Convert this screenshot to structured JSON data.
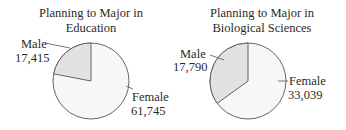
{
  "chart_data": [
    {
      "type": "pie",
      "title": "Planning to Major in Education",
      "title_lines": [
        "Planning to Major in",
        "Education"
      ],
      "categories": [
        "Male",
        "Female"
      ],
      "values": [
        17415,
        61745
      ],
      "value_labels": [
        "17,415",
        "61,745"
      ],
      "colors": [
        "#e2e2e2",
        "#f7f7f7"
      ],
      "start_angle_deg": 0,
      "direction": "counterclockwise"
    },
    {
      "type": "pie",
      "title": "Planning to Major in Biological Sciences",
      "title_lines": [
        "Planning to Major in",
        "Biological Sciences"
      ],
      "categories": [
        "Male",
        "Female"
      ],
      "values": [
        17790,
        33039
      ],
      "value_labels": [
        "17,790",
        "33,039"
      ],
      "colors": [
        "#e2e2e2",
        "#f7f7f7"
      ],
      "start_angle_deg": 0,
      "direction": "counterclockwise"
    }
  ],
  "charts": {
    "left": {
      "title1": "Planning to Major in",
      "title2": "Education",
      "male_label": "Male",
      "male_value": "17,415",
      "female_label": "Female",
      "female_value": "61,745"
    },
    "right": {
      "title1": "Planning to Major in",
      "title2": "Biological Sciences",
      "male_label": "Male",
      "male_value": "17,790",
      "female_label": "Female",
      "female_value": "33,039"
    }
  }
}
